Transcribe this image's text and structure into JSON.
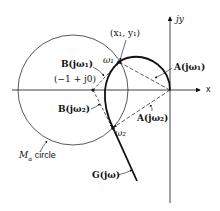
{
  "diagram": {
    "axes": {
      "x_label": "x",
      "y_label": "jy"
    },
    "labels": {
      "point_x1y1": "(x₁, y₁)",
      "omega1": "ω₁",
      "omega2": "ω₂",
      "A_jw1": "A(jω₁)",
      "A_jw2": "A(jω₂)",
      "B_jw1": "B(jω₁)",
      "B_jw2": "B(jω₂)",
      "critical_point": "(−1 + j0)",
      "m_circle_M": "M",
      "m_circle_sub": "α",
      "m_circle_text": " circle",
      "g_curve": "G(jω)"
    },
    "colors": {
      "stroke": "#111111",
      "background": "#ffffff"
    }
  }
}
